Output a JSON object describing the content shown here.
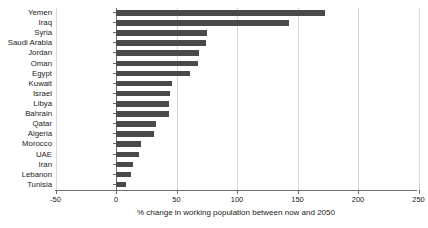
{
  "chart_data": {
    "type": "bar",
    "orientation": "horizontal",
    "title": "",
    "xlabel": "% change in working population between now and 2050",
    "ylabel": "",
    "xlim": [
      -50,
      250
    ],
    "xticks": [
      -50,
      0,
      50,
      100,
      150,
      200,
      250
    ],
    "xtick_labels": [
      "-50",
      "0",
      "50",
      "100",
      "150",
      "200",
      "250"
    ],
    "grid": true,
    "grid_axis": "x",
    "legend": null,
    "bar_color": "#4a4a4a",
    "categories": [
      "Yemen",
      "Iraq",
      "Syria",
      "Saudi Arabia",
      "Jordan",
      "Oman",
      "Egypt",
      "Kuwait",
      "Israel",
      "Libya",
      "Bahrain",
      "Qatar",
      "Algeria",
      "Morocco",
      "UAE",
      "Iran",
      "Lebanon",
      "Tunisia"
    ],
    "values": [
      173,
      143,
      75,
      74,
      69,
      68,
      61,
      46,
      45,
      44,
      44,
      33,
      31,
      21,
      19,
      14,
      12,
      8
    ]
  }
}
